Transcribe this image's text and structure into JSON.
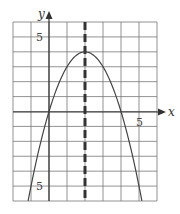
{
  "chart_data": {
    "type": "line",
    "title": "",
    "xlabel": "x",
    "ylabel": "y",
    "xlim": [
      -2,
      6
    ],
    "ylim": [
      -6,
      6
    ],
    "grid": true,
    "grid_step": 1,
    "tick_labels": {
      "x": [
        "5"
      ],
      "y": [
        "5",
        "-5"
      ]
    },
    "series": [
      {
        "name": "parabola",
        "equation": "y = -x^2 + 4x",
        "vertex": [
          2,
          4
        ],
        "x_intercepts": [
          0,
          4
        ],
        "x": [
          -1.16,
          -1,
          0,
          1,
          2,
          3,
          4,
          5,
          5.16
        ],
        "y": [
          -6,
          -5,
          0,
          3,
          4,
          3,
          0,
          -5,
          -6
        ]
      }
    ],
    "annotations": [
      {
        "type": "dashed-vertical-line",
        "x": 2,
        "label": "axis of symmetry"
      }
    ]
  },
  "labels": {
    "x_axis": "x",
    "y_axis": "y",
    "x_tick_5": "5",
    "y_tick_5": "5",
    "y_tick_neg5": "5"
  }
}
